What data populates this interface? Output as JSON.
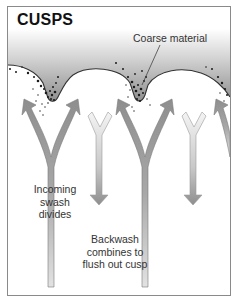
{
  "title": "CUSPS",
  "labels": {
    "coarse_material": "Coarse material",
    "incoming_swash": [
      "Incoming",
      "swash",
      "divides"
    ],
    "backwash": [
      "Backwash",
      "combines to",
      "flush out cusp"
    ]
  },
  "colors": {
    "frame_border": "#8a8a8a",
    "gradient_top": "#ffffff",
    "gradient_bottom": "#8f8f8f",
    "swash_arrow": "#9a9a9a",
    "backwash_arrow": "#e6e6e6",
    "sediment_dots": "#1a1a1a",
    "text": "#333333"
  },
  "legend_semantics": {
    "dark_arrows": "incoming swash dividing around cusp horns",
    "light_arrows": "backwash combining in bays"
  }
}
